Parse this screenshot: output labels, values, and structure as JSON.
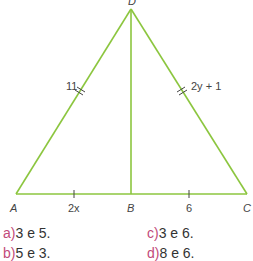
{
  "figure": {
    "vertices": {
      "A": "A",
      "B": "B",
      "C": "C",
      "D": "D"
    },
    "labels": {
      "AD": "11",
      "DC": "2y + 1",
      "AB": "2x",
      "BC": "6"
    },
    "line_color": "#8cc63f"
  },
  "options": [
    {
      "key": "a)",
      "text": "3 e 5."
    },
    {
      "key": "b)",
      "text": "5 e 3."
    },
    {
      "key": "c)",
      "text": "3 e 6."
    },
    {
      "key": "d)",
      "text": "8 e 6."
    }
  ]
}
